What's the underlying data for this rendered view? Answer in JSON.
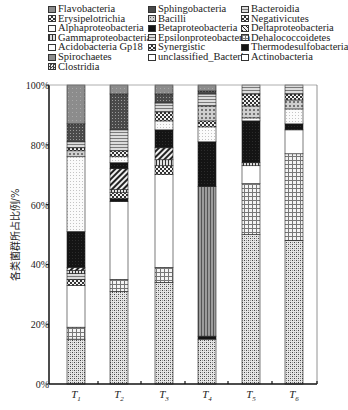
{
  "chart_data": {
    "type": "bar",
    "stacked": true,
    "title": "",
    "xlabel": "",
    "ylabel": "各类菌群所占比例/%",
    "ylim": [
      0,
      100
    ],
    "yticks": [
      "0%",
      "20%",
      "40%",
      "60%",
      "80%",
      "100%"
    ],
    "categories": [
      "T1",
      "T2",
      "T3",
      "T4",
      "T5",
      "T6"
    ],
    "legend_position": "top",
    "series_order_bottom_to_top": [
      "Dehalococcoidetes-like (cross-hatch)",
      "grid",
      "unclassified_Bacteria",
      "others..."
    ],
    "bars": [
      {
        "name": "T1",
        "segments": [
          {
            "series": "Clostridia",
            "from": 0,
            "to": 15,
            "pattern": "checker"
          },
          {
            "series": "Dehalococcoidetes",
            "from": 15,
            "to": 19,
            "pattern": "grid"
          },
          {
            "series": "unclassified_Bacteria",
            "from": 19,
            "to": 33,
            "pattern": "white"
          },
          {
            "series": "Synergistic",
            "from": 33,
            "to": 35,
            "pattern": "bigcheck"
          },
          {
            "series": "Epsilonproteobacteria",
            "from": 35,
            "to": 37,
            "pattern": "hlines"
          },
          {
            "series": "Gammaproteobacteria",
            "from": 37,
            "to": 38,
            "pattern": "vlines"
          },
          {
            "series": "Deltaproteobacteria",
            "from": 38,
            "to": 39,
            "pattern": "diag"
          },
          {
            "series": "Betaproteobacteria",
            "from": 39,
            "to": 51,
            "pattern": "black"
          },
          {
            "series": "Alphaproteobacteria",
            "from": 51,
            "to": 76,
            "pattern": "lightdot"
          },
          {
            "series": "Bacilli",
            "from": 76,
            "to": 78,
            "pattern": "dotted"
          },
          {
            "series": "Negativicutes",
            "from": 78,
            "to": 79,
            "pattern": "bigcheck"
          },
          {
            "series": "Bacteroidia",
            "from": 79,
            "to": 81,
            "pattern": "hlines"
          },
          {
            "series": "Sphingobacteria",
            "from": 81,
            "to": 87,
            "pattern": "darkdot"
          },
          {
            "series": "Flavobacteria",
            "from": 87,
            "to": 100,
            "pattern": "gray"
          }
        ]
      },
      {
        "name": "T2",
        "segments": [
          {
            "series": "Clostridia",
            "from": 0,
            "to": 31,
            "pattern": "checker"
          },
          {
            "series": "Dehalococcoidetes",
            "from": 31,
            "to": 35,
            "pattern": "grid"
          },
          {
            "series": "unclassified_Bacteria",
            "from": 35,
            "to": 61,
            "pattern": "white"
          },
          {
            "series": "Synergistic",
            "from": 61,
            "to": 62,
            "pattern": "black"
          },
          {
            "series": "Spirochaetes",
            "from": 62,
            "to": 64,
            "pattern": "bigcheck"
          },
          {
            "series": "Gammaproteobacteria",
            "from": 64,
            "to": 65,
            "pattern": "vlines"
          },
          {
            "series": "Deltaproteobacteria",
            "from": 65,
            "to": 72,
            "pattern": "diag"
          },
          {
            "series": "Betaproteobacteria",
            "from": 72,
            "to": 74,
            "pattern": "black"
          },
          {
            "series": "Alphaproteobacteria",
            "from": 74,
            "to": 76,
            "pattern": "lightdot"
          },
          {
            "series": "Negativicutes",
            "from": 76,
            "to": 78,
            "pattern": "bigcheck"
          },
          {
            "series": "Bacteroidia",
            "from": 78,
            "to": 85,
            "pattern": "hlines"
          },
          {
            "series": "Sphingobacteria",
            "from": 85,
            "to": 97,
            "pattern": "darkdot"
          },
          {
            "series": "Flavobacteria",
            "from": 97,
            "to": 100,
            "pattern": "gray"
          }
        ]
      },
      {
        "name": "T3",
        "segments": [
          {
            "series": "Clostridia",
            "from": 0,
            "to": 34,
            "pattern": "checker"
          },
          {
            "series": "Dehalococcoidetes",
            "from": 34,
            "to": 39,
            "pattern": "grid"
          },
          {
            "series": "unclassified_Bacteria",
            "from": 39,
            "to": 70,
            "pattern": "white"
          },
          {
            "series": "Spirochaetes",
            "from": 70,
            "to": 73,
            "pattern": "bigcheck"
          },
          {
            "series": "Gammaproteobacteria",
            "from": 73,
            "to": 75,
            "pattern": "vlines"
          },
          {
            "series": "Deltaproteobacteria",
            "from": 75,
            "to": 79,
            "pattern": "diag"
          },
          {
            "series": "Betaproteobacteria",
            "from": 79,
            "to": 85,
            "pattern": "black"
          },
          {
            "series": "Alphaproteobacteria",
            "from": 85,
            "to": 88,
            "pattern": "lightdot"
          },
          {
            "series": "Negativicutes",
            "from": 88,
            "to": 91,
            "pattern": "bigcheck"
          },
          {
            "series": "Bacteroidia",
            "from": 91,
            "to": 94,
            "pattern": "hlines"
          },
          {
            "series": "Sphingobacteria",
            "from": 94,
            "to": 97,
            "pattern": "darkdot"
          },
          {
            "series": "Flavobacteria",
            "from": 97,
            "to": 100,
            "pattern": "gray"
          }
        ]
      },
      {
        "name": "T4",
        "segments": [
          {
            "series": "Clostridia",
            "from": 0,
            "to": 15,
            "pattern": "checker"
          },
          {
            "series": "Thermodesulfobacteria",
            "from": 15,
            "to": 16,
            "pattern": "black"
          },
          {
            "series": "Acidobacteria Gp18",
            "from": 16,
            "to": 66,
            "pattern": "vlines-gray"
          },
          {
            "series": "Betaproteobacteria",
            "from": 66,
            "to": 81,
            "pattern": "black"
          },
          {
            "series": "Alphaproteobacteria",
            "from": 81,
            "to": 86,
            "pattern": "lightdot"
          },
          {
            "series": "Negativicutes",
            "from": 86,
            "to": 88,
            "pattern": "bigcheck"
          },
          {
            "series": "Bacilli",
            "from": 88,
            "to": 93,
            "pattern": "dotted"
          },
          {
            "series": "Bacteroidia",
            "from": 93,
            "to": 97,
            "pattern": "hlines"
          },
          {
            "series": "Sphingobacteria",
            "from": 97,
            "to": 98,
            "pattern": "darkdot"
          },
          {
            "series": "Flavobacteria",
            "from": 98,
            "to": 100,
            "pattern": "gray"
          }
        ]
      },
      {
        "name": "T5",
        "segments": [
          {
            "series": "Clostridia",
            "from": 0,
            "to": 50,
            "pattern": "checker"
          },
          {
            "series": "Dehalococcoidetes",
            "from": 50,
            "to": 67,
            "pattern": "grid"
          },
          {
            "series": "unclassified_Bacteria",
            "from": 67,
            "to": 73,
            "pattern": "white"
          },
          {
            "series": "Gammaproteobacteria",
            "from": 73,
            "to": 74,
            "pattern": "vlines"
          },
          {
            "series": "Thermodesulfobacteria",
            "from": 74,
            "to": 88,
            "pattern": "black"
          },
          {
            "series": "Alphaproteobacteria",
            "from": 88,
            "to": 89,
            "pattern": "lightdot"
          },
          {
            "series": "Bacilli",
            "from": 89,
            "to": 93,
            "pattern": "dotted"
          },
          {
            "series": "Negativicutes",
            "from": 93,
            "to": 97,
            "pattern": "bigcheck"
          },
          {
            "series": "Bacteroidia",
            "from": 97,
            "to": 100,
            "pattern": "hlines"
          }
        ]
      },
      {
        "name": "T6",
        "segments": [
          {
            "series": "Clostridia",
            "from": 0,
            "to": 48,
            "pattern": "checker"
          },
          {
            "series": "Dehalococcoidetes",
            "from": 48,
            "to": 77,
            "pattern": "grid"
          },
          {
            "series": "unclassified_Bacteria",
            "from": 77,
            "to": 85,
            "pattern": "white"
          },
          {
            "series": "Thermodesulfobacteria",
            "from": 85,
            "to": 87,
            "pattern": "black"
          },
          {
            "series": "Alphaproteobacteria",
            "from": 87,
            "to": 92,
            "pattern": "lightdot"
          },
          {
            "series": "Bacilli",
            "from": 92,
            "to": 95,
            "pattern": "dotted"
          },
          {
            "series": "Negativicutes",
            "from": 95,
            "to": 97,
            "pattern": "bigcheck"
          },
          {
            "series": "Bacteroidia",
            "from": 97,
            "to": 100,
            "pattern": "hlines"
          }
        ]
      }
    ],
    "legend": [
      "Flavobacteria",
      "Sphingobacteria",
      "Bacteroidia",
      "Erysipelotrichia",
      "Bacilli",
      "Negativicutes",
      "Alphaproteobacteria",
      "Betaproteobacteria",
      "Deltaproteobacteria",
      "Gammaproteobacteria",
      "Epsilonproteobacteria",
      "Dehalococcoidetes",
      "Acidobacteria Gp18",
      "Synergistic",
      "Thermodesulfobacteria",
      "Spirochaetes",
      "unclassified_Bacteria",
      "Actinobacteria",
      "Clostridia"
    ]
  },
  "legend": {
    "items": [
      {
        "label": "Flavobacteria",
        "pattern": "gray",
        "col": 0,
        "row": 0
      },
      {
        "label": "Sphingobacteria",
        "pattern": "darkdot",
        "col": 1,
        "row": 0
      },
      {
        "label": "Bacteroidia",
        "pattern": "hlines",
        "col": 2,
        "row": 0
      },
      {
        "label": "Erysipelotrichia",
        "pattern": "bigcheck",
        "col": 0,
        "row": 1
      },
      {
        "label": "Bacilli",
        "pattern": "dotted",
        "col": 1,
        "row": 1
      },
      {
        "label": "Negativicutes",
        "pattern": "bigcheck",
        "col": 2,
        "row": 1
      },
      {
        "label": "Alphaproteobacteria",
        "pattern": "lightdot",
        "col": 0,
        "row": 2
      },
      {
        "label": "Betaproteobacteria",
        "pattern": "black",
        "col": 1,
        "row": 2
      },
      {
        "label": "Deltaproteobacteria",
        "pattern": "diag",
        "col": 2,
        "row": 2
      },
      {
        "label": "Gammaproteobacteria",
        "pattern": "vlines",
        "col": 0,
        "row": 3
      },
      {
        "label": "Epsilonproteobacteria",
        "pattern": "hlines",
        "col": 1,
        "row": 3
      },
      {
        "label": "Dehalococcoidetes",
        "pattern": "grid",
        "col": 2,
        "row": 3
      },
      {
        "label": "Acidobacteria Gp18",
        "pattern": "lightdot",
        "col": 0,
        "row": 4
      },
      {
        "label": "Synergistic",
        "pattern": "bigcheck",
        "col": 1,
        "row": 4
      },
      {
        "label": "Thermodesulfobacteria",
        "pattern": "black",
        "col": 2,
        "row": 4
      },
      {
        "label": "Spirochaetes",
        "pattern": "gray",
        "col": 0,
        "row": 5
      },
      {
        "label": "unclassified_Bacteria",
        "pattern": "white",
        "col": 1,
        "row": 5
      },
      {
        "label": "Actinobacteria",
        "pattern": "white",
        "col": 2,
        "row": 5
      },
      {
        "label": "Clostridia",
        "pattern": "checker",
        "col": 0,
        "row": 6
      }
    ]
  },
  "axis": {
    "ylabel": "各类菌群所占比例/%",
    "yticks": [
      "0%",
      "20%",
      "40%",
      "60%",
      "80%",
      "100%"
    ],
    "xticks": [
      {
        "main": "T",
        "sub": "1"
      },
      {
        "main": "T",
        "sub": "2"
      },
      {
        "main": "T",
        "sub": "3"
      },
      {
        "main": "T",
        "sub": "4"
      },
      {
        "main": "T",
        "sub": "5"
      },
      {
        "main": "T",
        "sub": "6"
      }
    ]
  }
}
